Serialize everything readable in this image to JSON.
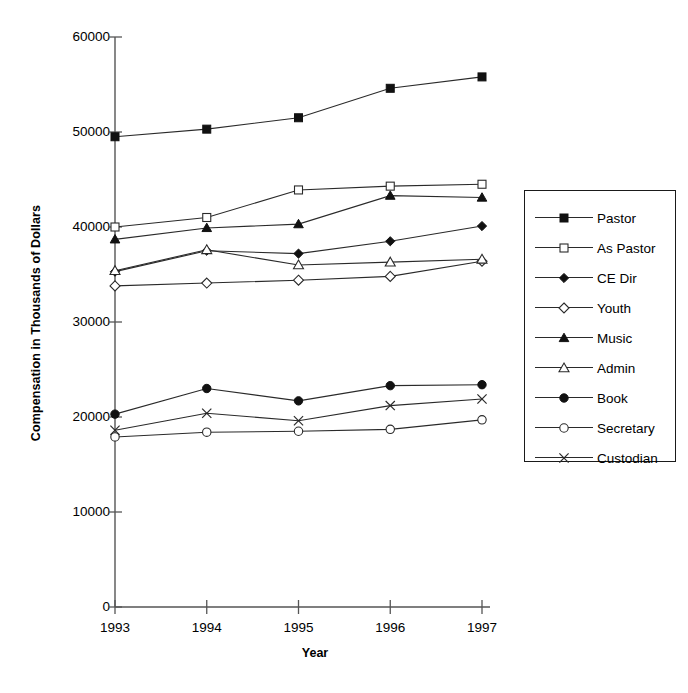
{
  "chart_data": {
    "type": "line",
    "title": "",
    "xlabel": "Year",
    "ylabel": "Compensation in Thousands of Dollars",
    "categories": [
      "1993",
      "1994",
      "1995",
      "1996",
      "1997"
    ],
    "x": [
      1993,
      1994,
      1995,
      1996,
      1997
    ],
    "ylim": [
      0,
      60000
    ],
    "yticks": [
      0,
      10000,
      20000,
      30000,
      40000,
      50000,
      60000
    ],
    "ytick_labels": [
      "0",
      "10000",
      "20000",
      "30000",
      "40000",
      "50000",
      "60000"
    ],
    "grid": false,
    "legend_position": "right",
    "series": [
      {
        "name": "Pastor",
        "marker": "filled-square",
        "values": [
          49500,
          50300,
          51500,
          54600,
          55800
        ]
      },
      {
        "name": "As Pastor",
        "marker": "open-square",
        "values": [
          40000,
          41000,
          43900,
          44300,
          44500
        ]
      },
      {
        "name": "CE Dir",
        "marker": "filled-diamond",
        "values": [
          35300,
          37500,
          37200,
          38500,
          40100
        ]
      },
      {
        "name": "Youth",
        "marker": "open-diamond",
        "values": [
          33800,
          34100,
          34400,
          34800,
          36400
        ]
      },
      {
        "name": "Music",
        "marker": "filled-triangle",
        "values": [
          38700,
          39900,
          40300,
          43300,
          43100
        ]
      },
      {
        "name": "Admin",
        "marker": "open-triangle",
        "values": [
          35400,
          37600,
          36000,
          36300,
          36600
        ]
      },
      {
        "name": "Book",
        "marker": "filled-circle",
        "values": [
          20300,
          23000,
          21700,
          23300,
          23400
        ]
      },
      {
        "name": "Secretary",
        "marker": "open-circle",
        "values": [
          17900,
          18400,
          18500,
          18700,
          19700
        ]
      },
      {
        "name": "Custodian",
        "marker": "cross",
        "values": [
          18600,
          20400,
          19600,
          21200,
          21900
        ]
      }
    ]
  },
  "legend": {
    "items": [
      {
        "label": "Pastor"
      },
      {
        "label": "As Pastor"
      },
      {
        "label": "CE Dir"
      },
      {
        "label": "Youth"
      },
      {
        "label": "Music"
      },
      {
        "label": "Admin"
      },
      {
        "label": "Book"
      },
      {
        "label": "Secretary"
      },
      {
        "label": "Custodian"
      }
    ]
  },
  "colors": {
    "line": "#2a2a2a",
    "axis": "#555555",
    "text": "#000000",
    "background": "#ffffff"
  }
}
